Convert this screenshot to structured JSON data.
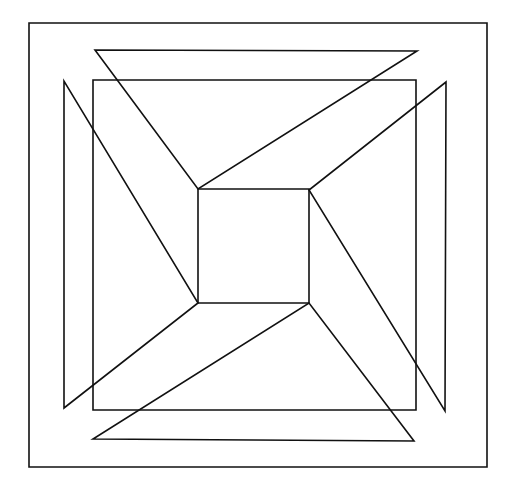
{
  "diagram": {
    "canvas": {
      "width": 507,
      "height": 483,
      "background": "#ffffff",
      "stroke": "#111111"
    },
    "shapes": {
      "outer_frame": {
        "type": "rect",
        "points": "29,23 487,23 487,467 29,467"
      },
      "middle_square": {
        "type": "rect",
        "points": "93,80 416,80 416,410 93,410"
      },
      "inner_square": {
        "type": "rect",
        "points": "198,189 309,189 309,303 198,303"
      },
      "top_triangle": {
        "type": "polygon",
        "points": "95,50 417,51 198,189"
      },
      "bottom_triangle": {
        "type": "polygon",
        "points": "93,439 414,441 309,303"
      },
      "left_triangle": {
        "type": "polygon",
        "points": "64,81 64,408 198,303"
      },
      "right_triangle": {
        "type": "polygon",
        "points": "446,82 445,411 309,190"
      }
    }
  }
}
